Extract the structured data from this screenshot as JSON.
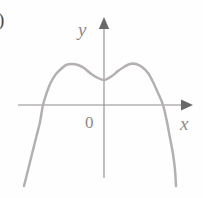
{
  "figure": {
    "partial_corner_label": ")",
    "background_color": "#fefefe"
  },
  "axes": {
    "x_axis_label": "x",
    "y_axis_label": "y",
    "origin_label": "0",
    "axis_color": "#8d8a8a",
    "arrow_color": "#6a6a6a"
  },
  "chart_data": {
    "type": "line",
    "title": "",
    "subtitle": "",
    "xlabel": "x",
    "ylabel": "y",
    "legend": [],
    "grid": false,
    "axis_style": "cartesian-arrows",
    "origin_label": "0",
    "curve_color": "#b5b0b0",
    "curve_width": 2.5,
    "axis_ranges": {
      "x_pixel_range": [
        18,
        190
      ],
      "y_pixel_range": [
        20,
        178
      ]
    },
    "features": {
      "local_maxima": [
        {
          "x_px": 72,
          "y_px": 64
        },
        {
          "x_px": 133,
          "y_px": 64
        }
      ],
      "local_minimum": {
        "x_px": 104,
        "y_px": 80
      },
      "x_intercepts_px": [
        43,
        163
      ],
      "left_endpoint_px": {
        "x_px": 24,
        "y_px": 186
      },
      "right_endpoint_px": {
        "x_px": 176,
        "y_px": 186
      }
    },
    "series": [
      {
        "name": "curve",
        "points_px": [
          [
            24,
            186
          ],
          [
            28,
            170
          ],
          [
            32,
            154
          ],
          [
            36,
            138
          ],
          [
            40,
            122
          ],
          [
            43,
            105
          ],
          [
            47,
            92
          ],
          [
            51,
            82
          ],
          [
            56,
            74
          ],
          [
            61,
            69
          ],
          [
            66,
            65
          ],
          [
            72,
            64
          ],
          [
            78,
            65
          ],
          [
            84,
            68
          ],
          [
            90,
            73
          ],
          [
            96,
            77
          ],
          [
            104,
            80
          ],
          [
            112,
            76
          ],
          [
            118,
            71
          ],
          [
            124,
            67
          ],
          [
            130,
            64
          ],
          [
            136,
            64
          ],
          [
            142,
            67
          ],
          [
            148,
            73
          ],
          [
            153,
            82
          ],
          [
            158,
            93
          ],
          [
            163,
            105
          ],
          [
            167,
            122
          ],
          [
            170,
            138
          ],
          [
            173,
            154
          ],
          [
            175,
            170
          ],
          [
            176,
            186
          ]
        ]
      }
    ]
  }
}
